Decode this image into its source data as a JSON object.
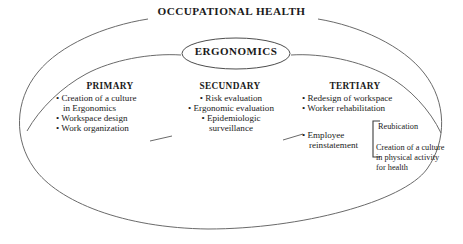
{
  "diagram": {
    "title": "OCCUPATIONAL HEALTH",
    "center_node": "ERGONOMICS",
    "columns": [
      {
        "heading": "PRIMARY",
        "items": [
          "Creation of a culture",
          "in Ergonomics",
          "Workspace design",
          "Work organization"
        ]
      },
      {
        "heading": "SECUNDARY",
        "items": [
          "Risk evaluation",
          "Ergonomic evaluation",
          "Epidemiologic",
          "surveillance"
        ]
      },
      {
        "heading": "TERTIARY",
        "items": [
          "Redesign of workspace",
          "Worker rehabilitation"
        ]
      }
    ],
    "tertiary_extra": {
      "label_line1": "Employee",
      "label_line2": "reinstatement",
      "bracket_items": [
        "Reubication",
        "Creation of a culture in physical activity for health"
      ],
      "bracket_item2_lines": [
        "Creation of a culture",
        "in physical activity",
        "for health"
      ]
    },
    "bullet_glyph": "•",
    "colors": {
      "stroke": "#5a5a5a",
      "text": "#1a1a1a",
      "background": "#ffffff"
    }
  }
}
